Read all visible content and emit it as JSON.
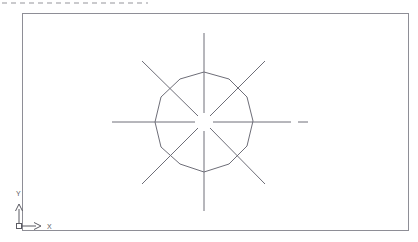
{
  "page": {
    "width": 418,
    "height": 242,
    "background_color": "#ffffff"
  },
  "scan_artifact": {
    "name": "top-dashed-edge",
    "visible": true,
    "color": "#b9b9bd",
    "x1": 2,
    "x2": 148,
    "y": 3,
    "dash_pattern": "5 4",
    "stroke_width": 1.4
  },
  "viewport_frame": {
    "label": "drawing-area-border",
    "color": "#8e8e96",
    "stroke_width": 1,
    "x": 22.5,
    "y": 13.5,
    "width": 386,
    "height": 217
  },
  "geometry": {
    "center": {
      "x": 204,
      "y": 122
    },
    "polygon": {
      "name": "polygon-12-sided",
      "sides": 12,
      "circumradius": 50,
      "color": "#6e6e78",
      "stroke_width": 1,
      "note": "hand-plotted polygon, slightly irregular vertices",
      "points": "204,72 229,79 247,97 253,121 247,146 229,164 204,172 180,164 161,147 155,122 161,97 180,79"
    },
    "centerlines": {
      "name": "radial-centerlines",
      "count": 8,
      "color": "#6e6e78",
      "stroke_width": 1,
      "center_gap_radius": 9,
      "angles_deg": [
        0,
        45,
        90,
        135,
        180,
        225,
        270,
        315
      ],
      "segments": [
        {
          "name": "centerline-vertical-up",
          "x1": 204,
          "y1": 33,
          "x2": 204,
          "y2": 113
        },
        {
          "name": "centerline-vertical-down",
          "x1": 204,
          "y1": 131,
          "x2": 204,
          "y2": 211
        },
        {
          "name": "centerline-horizontal-left",
          "x1": 112,
          "y1": 122,
          "x2": 195,
          "y2": 122
        },
        {
          "name": "centerline-horizontal-right",
          "x1": 213,
          "y1": 122,
          "x2": 291,
          "y2": 122
        },
        {
          "name": "centerline-diagonal-up-right",
          "x1": 265,
          "y1": 61,
          "x2": 210,
          "y2": 116
        },
        {
          "name": "centerline-diagonal-down-left",
          "x1": 198,
          "y1": 128,
          "x2": 142,
          "y2": 184
        },
        {
          "name": "centerline-diagonal-up-left",
          "x1": 142,
          "y1": 61,
          "x2": 198,
          "y2": 116
        },
        {
          "name": "centerline-diagonal-down-right",
          "x1": 210,
          "y1": 128,
          "x2": 265,
          "y2": 184
        }
      ],
      "extension_dash": {
        "name": "centerline-right-extension-dash",
        "x1": 298,
        "y1": 122,
        "x2": 308,
        "y2": 122
      }
    }
  },
  "ucs_icon": {
    "name": "ucs-coordinate-icon",
    "color": "#5a5a62",
    "stroke_width": 1,
    "origin": {
      "x": 19,
      "y": 226
    },
    "x_axis": {
      "label": "X",
      "label_x": 47,
      "label_y": 229,
      "line_x1": 22,
      "line_y1": 226,
      "line_x2": 36,
      "line_y2": 226,
      "arrow": "34,222.5 41,226 34,229.5"
    },
    "y_axis": {
      "label": "Y",
      "label_x": 16,
      "label_y": 196,
      "line_x1": 19,
      "line_y1": 223,
      "line_x2": 19,
      "line_y2": 209,
      "arrow": "15.5,211 19,204 22.5,211"
    },
    "origin_box": {
      "name": "ucs-origin-square",
      "x": 16.5,
      "y": 223.5,
      "size": 5
    }
  }
}
